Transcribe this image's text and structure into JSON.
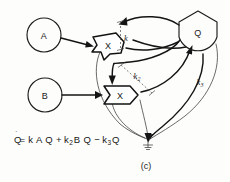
{
  "figure": {
    "panel_label": "(c)",
    "equation": {
      "lhs": "Q",
      "lhs_dot": "˙",
      "full_text": "Q̇ = kAQ + k2BQ − k3Q",
      "parts": [
        {
          "text": "= k A Q +",
          "kind": "plain"
        },
        {
          "text": "k",
          "sub": "2",
          "kind": "term"
        },
        {
          "text": "B Q −",
          "kind": "plain"
        },
        {
          "text": "k",
          "sub": "3",
          "kind": "term"
        },
        {
          "text": "Q",
          "kind": "plain"
        }
      ]
    }
  },
  "nodes": {
    "a": {
      "label": "A",
      "shape": "circle"
    },
    "b": {
      "label": "B",
      "shape": "circle"
    },
    "q": {
      "label": "Q",
      "shape": "pentagon-round"
    },
    "reaction1": {
      "label": "X",
      "shape": "chevron-box"
    },
    "reaction2": {
      "label": "X",
      "shape": "chevron-box"
    },
    "sink": {
      "label": "",
      "shape": "sink-arrow"
    }
  },
  "rate_constants": [
    {
      "id": "k1",
      "base": "k",
      "sub": ""
    },
    {
      "id": "k2",
      "base": "k",
      "sub": "2"
    },
    {
      "id": "k3",
      "base": "k",
      "sub": "3"
    }
  ],
  "colors": {
    "ink": "#1c1c1c",
    "ink_light": "#3a3a3a",
    "paper": "#fdfdfb"
  }
}
